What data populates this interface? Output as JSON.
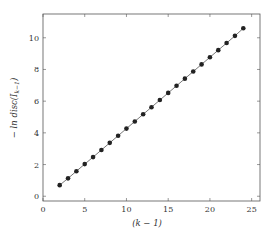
{
  "chart_data": {
    "type": "line",
    "title": "",
    "xlabel": "(k − 1)",
    "ylabel": "− ln disc(I_{k−1})",
    "xlim": [
      0,
      26
    ],
    "ylim": [
      -0.3,
      11.5
    ],
    "xticks": [
      0,
      5,
      10,
      15,
      20,
      25
    ],
    "yticks": [
      0,
      2,
      4,
      6,
      8,
      10
    ],
    "grid": false,
    "legend": null,
    "series": [
      {
        "name": "−ln disc",
        "marker": "filled-circle",
        "color": "#222222",
        "x": [
          2,
          3,
          4,
          5,
          6,
          7,
          8,
          9,
          10,
          11,
          12,
          13,
          14,
          15,
          16,
          17,
          18,
          19,
          20,
          21,
          22,
          23,
          24
        ],
        "y": [
          0.7,
          1.13,
          1.58,
          2.03,
          2.47,
          2.92,
          3.37,
          3.82,
          4.27,
          4.72,
          5.17,
          5.62,
          6.07,
          6.52,
          6.97,
          7.42,
          7.87,
          8.32,
          8.77,
          9.22,
          9.67,
          10.12,
          10.6
        ]
      }
    ]
  },
  "labels": {
    "xlabel": "(k − 1)",
    "ylabel": "− ln disc(I",
    "ylabel_sub": "k−1",
    "ylabel_close": ")"
  }
}
